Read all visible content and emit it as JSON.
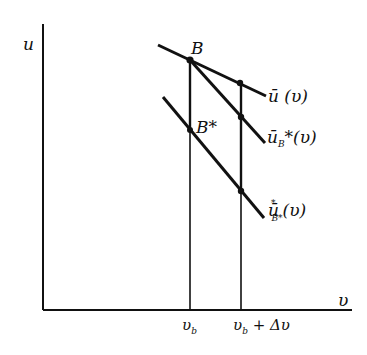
{
  "figure": {
    "type": "diagram",
    "colors": {
      "ink": "#111111",
      "background": "#ffffff"
    },
    "axes": {
      "y_label": "u",
      "x_label": "υ",
      "origin": [
        43,
        310
      ],
      "y_top": 24,
      "x_right": 352
    },
    "ticks": [
      {
        "id": "vb",
        "label": "υ",
        "sub": "b",
        "x": 190
      },
      {
        "id": "vb_dv",
        "label": "υ",
        "sub": "b",
        "suffix": " + Δυ",
        "x": 241
      }
    ],
    "lines": [
      {
        "id": "u-bar",
        "label_main": "ū (υ)",
        "from": [
          158,
          45
        ],
        "to": [
          266,
          96
        ]
      },
      {
        "id": "u-bar-B-star",
        "label_main": "ū",
        "label_sub": "B",
        "label_suffix": "*(υ)",
        "from": [
          190,
          60
        ],
        "to": [
          265,
          143
        ]
      },
      {
        "id": "u-bar-star-B-star",
        "label_main": "ū",
        "label_sup": "*",
        "label_sub": "B*",
        "label_suffix": "(υ)",
        "from": [
          163,
          97
        ],
        "to": [
          264,
          218
        ]
      }
    ],
    "points": [
      {
        "id": "B",
        "label": "B",
        "x": 190,
        "y": 60
      },
      {
        "id": "B-star",
        "label": "B*",
        "x": 190,
        "y": 130
      },
      {
        "id": "p-top-right",
        "x": 240,
        "y": 83
      },
      {
        "id": "p-mid-right",
        "x": 241,
        "y": 117
      },
      {
        "id": "p-low-right",
        "x": 241,
        "y": 191
      }
    ],
    "labels": {
      "u_axis": "u",
      "v_axis": "υ",
      "point_B": "B",
      "point_B_star": "B*",
      "curve1": "ū (υ)",
      "curve2_main": "ū",
      "curve2_sub": "B",
      "curve2_suffix": "*(υ)",
      "curve3_main": "ū",
      "curve3_sup": "*",
      "curve3_sub": "B*",
      "curve3_suffix": "(υ)",
      "tick1_main": "υ",
      "tick1_sub": "b",
      "tick2_main": "υ",
      "tick2_sub": "b",
      "tick2_suffix": " + Δυ"
    }
  }
}
